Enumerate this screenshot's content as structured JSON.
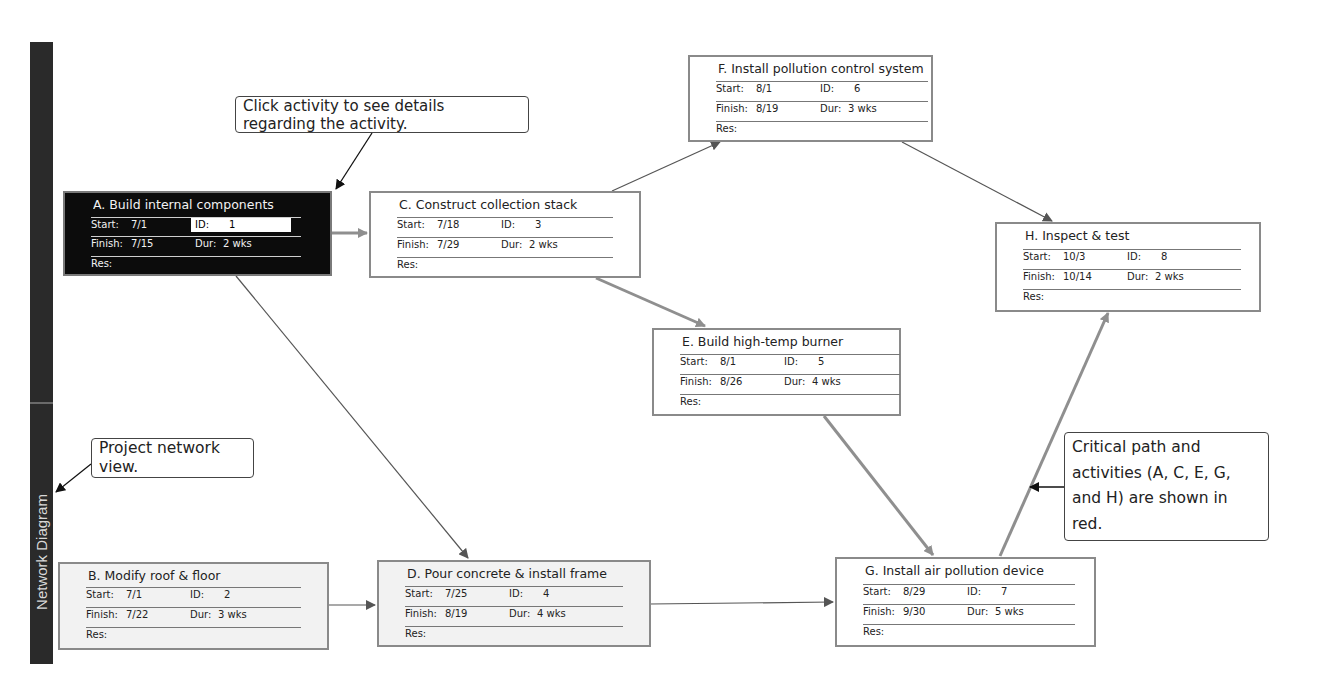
{
  "sidebar": {
    "label": "Network Diagram"
  },
  "callouts": {
    "click_activity": "Click activity to see details regarding the activity.",
    "project_view": "Project network view.",
    "critical_path": "Critical path and activities (A, C, E, G, and H) are shown in red."
  },
  "field_labels": {
    "start": "Start:",
    "finish": "Finish:",
    "id": "ID:",
    "dur": "Dur:",
    "res": "Res:"
  },
  "activities": {
    "A": {
      "title": "A. Build internal components",
      "start": "7/1",
      "finish": "7/15",
      "id": "1",
      "dur": "2 wks",
      "res": "",
      "critical": true,
      "selected": true
    },
    "B": {
      "title": "B. Modify roof & floor",
      "start": "7/1",
      "finish": "7/22",
      "id": "2",
      "dur": "3 wks",
      "res": "",
      "critical": false
    },
    "C": {
      "title": "C. Construct collection stack",
      "start": "7/18",
      "finish": "7/29",
      "id": "3",
      "dur": "2 wks",
      "res": "",
      "critical": true
    },
    "D": {
      "title": "D. Pour concrete & install frame",
      "start": "7/25",
      "finish": "8/19",
      "id": "4",
      "dur": "4 wks",
      "res": "",
      "critical": false
    },
    "E": {
      "title": "E. Build high-temp burner",
      "start": "8/1",
      "finish": "8/26",
      "id": "5",
      "dur": "4 wks",
      "res": "",
      "critical": true
    },
    "F": {
      "title": "F. Install pollution control system",
      "start": "8/1",
      "finish": "8/19",
      "id": "6",
      "dur": "3 wks",
      "res": "",
      "critical": false
    },
    "G": {
      "title": "G. Install air pollution device",
      "start": "8/29",
      "finish": "9/30",
      "id": "7",
      "dur": "5 wks",
      "res": "",
      "critical": true
    },
    "H": {
      "title": "H. Inspect & test",
      "start": "10/3",
      "finish": "10/14",
      "id": "8",
      "dur": "2 wks",
      "res": "",
      "critical": true
    }
  },
  "dependencies": [
    [
      "A",
      "C"
    ],
    [
      "A",
      "D"
    ],
    [
      "B",
      "D"
    ],
    [
      "C",
      "F"
    ],
    [
      "C",
      "E"
    ],
    [
      "D",
      "G"
    ],
    [
      "E",
      "G"
    ],
    [
      "F",
      "H"
    ],
    [
      "G",
      "H"
    ]
  ],
  "colors": {
    "critical_link": "#8f8f8f",
    "normal_link": "#555555",
    "selected_fill": "#0c0c0c"
  }
}
